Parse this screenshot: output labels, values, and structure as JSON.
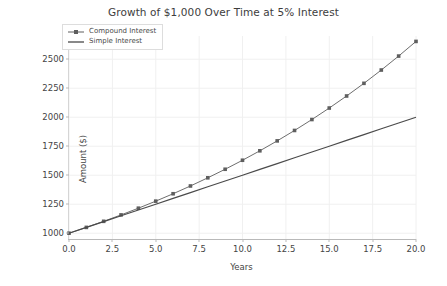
{
  "chart_data": {
    "type": "line",
    "title": "Growth of $1,000 Over Time at 5% Interest",
    "xlabel": "Years",
    "ylabel": "Amount ($)",
    "xlim": [
      0,
      20
    ],
    "ylim": [
      950,
      2700
    ],
    "grid": true,
    "legend_position": "upper left",
    "xticks": [
      "0.0",
      "2.5",
      "5.0",
      "7.5",
      "10.0",
      "12.5",
      "15.0",
      "17.5",
      "20.0"
    ],
    "xtick_values": [
      0,
      2.5,
      5,
      7.5,
      10,
      12.5,
      15,
      17.5,
      20
    ],
    "yticks": [
      "1000",
      "1250",
      "1500",
      "1750",
      "2000",
      "2250",
      "2500"
    ],
    "ytick_values": [
      1000,
      1250,
      1500,
      1750,
      2000,
      2250,
      2500
    ],
    "x": [
      0,
      1,
      2,
      3,
      4,
      5,
      6,
      7,
      8,
      9,
      10,
      11,
      12,
      13,
      14,
      15,
      16,
      17,
      18,
      19,
      20
    ],
    "series": [
      {
        "name": "Compound Interest",
        "marker": "square",
        "color": "#5e5e5e",
        "values": [
          1000,
          1050,
          1102.5,
          1157.63,
          1215.51,
          1276.28,
          1340.1,
          1407.1,
          1477.46,
          1551.33,
          1628.89,
          1710.34,
          1795.86,
          1885.65,
          1979.93,
          2078.93,
          2182.87,
          2292.02,
          2406.62,
          2526.95,
          2653.3
        ]
      },
      {
        "name": "Simple Interest",
        "marker": "none",
        "color": "#4a4a4a",
        "values": [
          1000,
          1050,
          1100,
          1150,
          1200,
          1250,
          1300,
          1350,
          1400,
          1450,
          1500,
          1550,
          1600,
          1650,
          1700,
          1750,
          1800,
          1850,
          1900,
          1950,
          2000
        ]
      }
    ]
  }
}
